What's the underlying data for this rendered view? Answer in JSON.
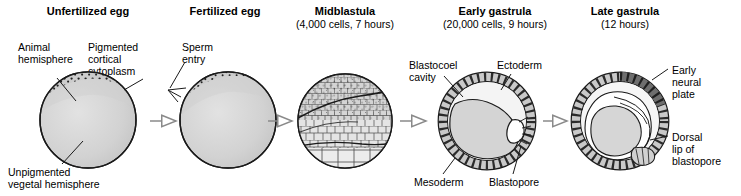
{
  "stages": [
    {
      "id": "unfertilized-egg",
      "title": "Unfertilized egg",
      "subtitle": ""
    },
    {
      "id": "fertilized-egg",
      "title": "Fertilized egg",
      "subtitle": ""
    },
    {
      "id": "midblastula",
      "title": "Midblastula",
      "subtitle": "(4,000 cells, 7 hours)"
    },
    {
      "id": "early-gastrula",
      "title": "Early gastrula",
      "subtitle": "(20,000 cells, 9 hours)"
    },
    {
      "id": "late-gastrula",
      "title": "Late gastrula",
      "subtitle": "(12 hours)"
    }
  ],
  "labels": {
    "animal_hemisphere": "Animal\nhemisphere",
    "pigmented_cortical_cytoplasm": "Pigmented\ncortical\ncytoplasm",
    "unpigmented_vegetal_hemisphere": "Unpigmented\nvegetal hemisphere",
    "sperm_entry": "Sperm\nentry",
    "blastocoel_cavity": "Blastocoel\ncavity",
    "ectoderm": "Ectoderm",
    "endoderm": "Endoderm",
    "mesoderm": "Mesoderm",
    "blastopore": "Blastopore",
    "early_neural_plate": "Early\nneural\nplate",
    "dorsal_lip_of_blastopore": "Dorsal\nlip of\nblastopore"
  },
  "colors": {
    "ink": "#000000",
    "background": "#ffffff",
    "cytoplasm_fill": "#cfcfcf",
    "pale_fill": "#e8e8e8",
    "ectoderm_fill": "#c9c9c9",
    "neural_plate_fill": "#6e6e6e",
    "arrow_stroke": "#808080"
  },
  "arrows": {
    "count": 4,
    "style": "open-outline-arrow"
  }
}
